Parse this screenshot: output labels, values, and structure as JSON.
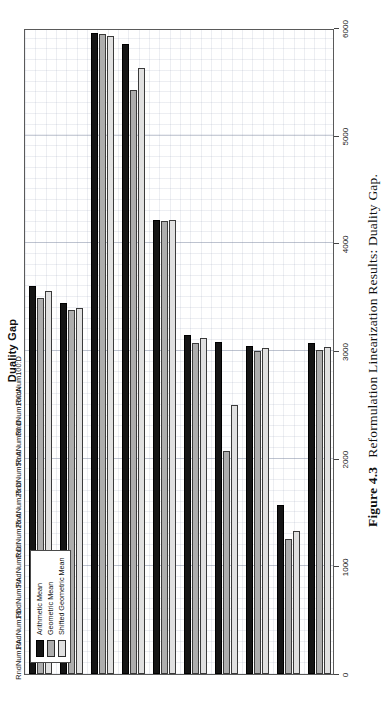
{
  "figure": {
    "number": "Figure 4.3",
    "caption": "Reformulation Linearization Results: Duality Gap."
  },
  "chart_title": "Duality Gap",
  "legend": {
    "position": "top-left-inside",
    "items": [
      {
        "label": "Arithmetic Mean",
        "color": "#151515"
      },
      {
        "label": "Geometric Mean",
        "color": "#adadad"
      },
      {
        "label": "Shifted Geometric Mean",
        "color": "#e0e0e0"
      }
    ]
  },
  "axis": {
    "value_ticks": [
      "0",
      "1000",
      "2000",
      "3000",
      "4000",
      "5000",
      "6000"
    ],
    "value_min": 0,
    "value_max": 6000
  },
  "chart_data": {
    "type": "bar",
    "orientation": "horizontal",
    "title": "Duality Gap",
    "xlabel": "",
    "ylabel": "",
    "xlim": [
      0,
      6000
    ],
    "grid": true,
    "legend_position": "upper left",
    "categories": [
      "RndNum1:A",
      "RndNum1:D",
      "RndNum5:A",
      "RndNum5:D",
      "RndNum25:A",
      "RndNum25:D",
      "RndNum50:A",
      "RndNum50:D",
      "RndNum100:A",
      "RndNum100:D"
    ],
    "series": [
      {
        "name": "Arithmetic Mean",
        "color": "#151515",
        "values": [
          3600,
          3450,
          5950,
          5850,
          4220,
          3150,
          3080,
          3050,
          1570,
          3070
        ]
      },
      {
        "name": "Geometric Mean",
        "color": "#adadad",
        "values": [
          3490,
          3380,
          5940,
          5420,
          4210,
          3070,
          2070,
          3000,
          1250,
          3010
        ]
      },
      {
        "name": "Shifted Geometric Mean",
        "color": "#e0e0e0",
        "values": [
          3560,
          3400,
          5930,
          5630,
          4215,
          3120,
          2500,
          3030,
          1330,
          3040
        ]
      }
    ]
  }
}
